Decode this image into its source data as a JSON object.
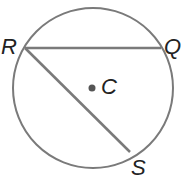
{
  "diagram": {
    "labels": {
      "R": "R",
      "Q": "Q",
      "C": "C",
      "S": "S"
    },
    "colors": {
      "stroke": "#7a7a7a",
      "text": "#222222",
      "dot": "#555555"
    }
  }
}
